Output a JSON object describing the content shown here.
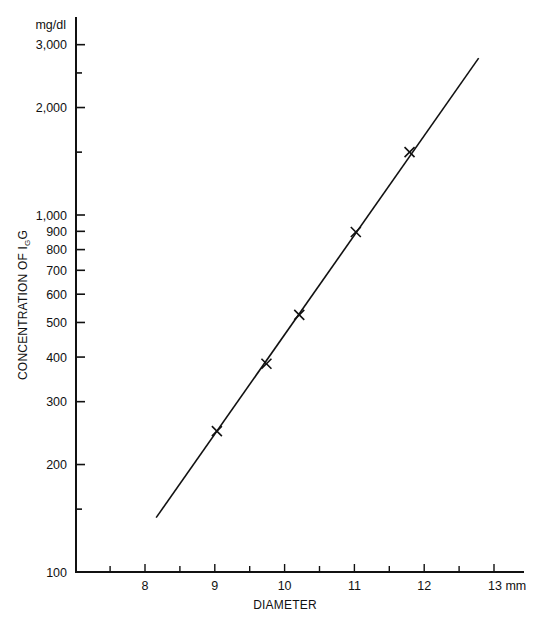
{
  "chart_data": {
    "type": "line",
    "title": "",
    "xlabel": "DIAMETER",
    "ylabel": "CONCENTRATION OF IgG",
    "ylabel_parts": {
      "prefix": "CONCENTRATION OF I",
      "subscript": "G",
      "suffix": "G"
    },
    "y_unit": "mg/dl",
    "x_unit_suffix": "13 mm",
    "yscale": "log",
    "xlim": [
      7.0,
      13.4
    ],
    "ylim": [
      100,
      3300
    ],
    "grid": false,
    "legend": null,
    "x_ticks": [
      {
        "value": 7.5,
        "label": ""
      },
      {
        "value": 8,
        "label": "8"
      },
      {
        "value": 8.5,
        "label": ""
      },
      {
        "value": 9,
        "label": "9"
      },
      {
        "value": 9.5,
        "label": ""
      },
      {
        "value": 10,
        "label": "10"
      },
      {
        "value": 10.5,
        "label": ""
      },
      {
        "value": 11,
        "label": "11"
      },
      {
        "value": 11.5,
        "label": ""
      },
      {
        "value": 12,
        "label": "12"
      },
      {
        "value": 12.5,
        "label": ""
      },
      {
        "value": 13,
        "label": "13 mm"
      }
    ],
    "y_ticks": [
      {
        "value": 100,
        "label": "100"
      },
      {
        "value": 150,
        "label": ""
      },
      {
        "value": 200,
        "label": "200"
      },
      {
        "value": 300,
        "label": "300"
      },
      {
        "value": 400,
        "label": "400"
      },
      {
        "value": 500,
        "label": "500"
      },
      {
        "value": 600,
        "label": "600"
      },
      {
        "value": 700,
        "label": "700"
      },
      {
        "value": 800,
        "label": "800"
      },
      {
        "value": 900,
        "label": "900"
      },
      {
        "value": 1000,
        "label": "1,000"
      },
      {
        "value": 1500,
        "label": ""
      },
      {
        "value": 2000,
        "label": "2,000"
      },
      {
        "value": 2500,
        "label": ""
      },
      {
        "value": 3000,
        "label": "3,000"
      }
    ],
    "series": [
      {
        "name": "measured points",
        "marker": "x",
        "x": [
          9.03,
          9.74,
          10.21,
          11.02,
          11.79
        ],
        "y": [
          248,
          383,
          525,
          896,
          1500
        ]
      },
      {
        "name": "fit line",
        "marker": "none",
        "x": [
          8.16,
          12.78
        ],
        "y": [
          142,
          2750
        ]
      }
    ]
  }
}
